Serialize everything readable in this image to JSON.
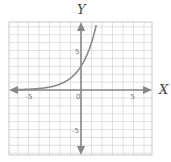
{
  "chart_data": {
    "type": "line",
    "title": "",
    "xlabel": "X",
    "ylabel": "Y",
    "xlim": [
      -6.5,
      6.5
    ],
    "ylim": [
      -8.5,
      8.5
    ],
    "grid": true,
    "x_ticks": [
      -5,
      0,
      5
    ],
    "y_ticks": [
      5,
      -5
    ],
    "tick_labels": {
      "x": [
        "-5",
        "0",
        "5"
      ],
      "y": [
        "5",
        "-5"
      ]
    },
    "series": [
      {
        "name": "exponential curve",
        "function": "y = 3 * 2^x",
        "x": [
          -6,
          -5,
          -4,
          -3,
          -2,
          -1,
          0,
          0.5,
          1,
          1.4
        ],
        "y": [
          0.05,
          0.09,
          0.19,
          0.38,
          0.75,
          1.5,
          3,
          4.2,
          6,
          7.9
        ],
        "color": "#8a8a8a"
      }
    ],
    "colors": {
      "grid": "#d8d8d8",
      "axis": "#888888",
      "curve": "#8a8a8a"
    }
  }
}
